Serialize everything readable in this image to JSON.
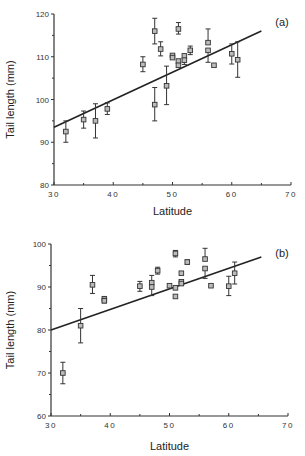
{
  "chart_data": [
    {
      "type": "scatter",
      "panel_label": "(a)",
      "title": "",
      "xlabel": "Latitude",
      "ylabel": "Tail length (mm)",
      "xlim": [
        30,
        70
      ],
      "ylim": [
        80,
        120
      ],
      "x_ticks": [
        30,
        40,
        50,
        60,
        70
      ],
      "y_ticks": [
        80,
        90,
        100,
        110,
        120
      ],
      "grid": false,
      "legend": null,
      "points": [
        {
          "x": 32,
          "y": 92.5,
          "lo": 90.0,
          "hi": 95.0
        },
        {
          "x": 35,
          "y": 95.3,
          "lo": 93.3,
          "hi": 97.3
        },
        {
          "x": 37,
          "y": 95.0,
          "lo": 91.0,
          "hi": 99.0
        },
        {
          "x": 39,
          "y": 97.8,
          "lo": 96.5,
          "hi": 99.2
        },
        {
          "x": 45,
          "y": 108.2,
          "lo": 106.5,
          "hi": 110.0
        },
        {
          "x": 47,
          "y": 116.0,
          "lo": 113.0,
          "hi": 119.0
        },
        {
          "x": 47,
          "y": 98.8,
          "lo": 95.0,
          "hi": 102.8
        },
        {
          "x": 48,
          "y": 111.8,
          "lo": 110.2,
          "hi": 113.5
        },
        {
          "x": 49,
          "y": 103.2,
          "lo": 98.8,
          "hi": 107.8
        },
        {
          "x": 50,
          "y": 110.3,
          "lo": null,
          "hi": null
        },
        {
          "x": 50,
          "y": 109.8,
          "lo": null,
          "hi": null
        },
        {
          "x": 51,
          "y": 116.5,
          "lo": 115.3,
          "hi": 118.0
        },
        {
          "x": 51,
          "y": 109.0,
          "lo": null,
          "hi": null
        },
        {
          "x": 51,
          "y": 108.0,
          "lo": null,
          "hi": null
        },
        {
          "x": 52,
          "y": 110.2,
          "lo": null,
          "hi": null
        },
        {
          "x": 52,
          "y": 109.2,
          "lo": 108.2,
          "hi": null
        },
        {
          "x": 53,
          "y": 111.5,
          "lo": 110.5,
          "hi": 112.5
        },
        {
          "x": 56,
          "y": 113.3,
          "lo": null,
          "hi": 116.5
        },
        {
          "x": 56,
          "y": 111.5,
          "lo": 108.7,
          "hi": null
        },
        {
          "x": 57,
          "y": 108.0,
          "lo": null,
          "hi": null
        },
        {
          "x": 60,
          "y": 110.7,
          "lo": 108.3,
          "hi": 113.0
        },
        {
          "x": 61,
          "y": 109.3,
          "lo": 105.2,
          "hi": 113.5
        }
      ],
      "regression_line": {
        "x": [
          30,
          65
        ],
        "y": [
          93.5,
          116.0
        ]
      }
    },
    {
      "type": "scatter",
      "panel_label": "(b)",
      "title": "",
      "xlabel": "Latitude",
      "ylabel": "Tail length (mm)",
      "xlim": [
        30,
        70
      ],
      "ylim": [
        60,
        100
      ],
      "x_ticks": [
        30,
        40,
        50,
        60,
        70
      ],
      "y_ticks": [
        60,
        70,
        80,
        90,
        100
      ],
      "grid": false,
      "legend": null,
      "points": [
        {
          "x": 32,
          "y": 70.0,
          "lo": 67.5,
          "hi": 72.5
        },
        {
          "x": 35,
          "y": 81.0,
          "lo": 77.0,
          "hi": 85.0
        },
        {
          "x": 37,
          "y": 90.5,
          "lo": 88.5,
          "hi": 92.7
        },
        {
          "x": 39,
          "y": 87.2,
          "lo": null,
          "hi": 87.8
        },
        {
          "x": 39,
          "y": 86.8,
          "lo": 86.3,
          "hi": null
        },
        {
          "x": 45,
          "y": 90.2,
          "lo": 89.0,
          "hi": 91.3
        },
        {
          "x": 47,
          "y": 91.0,
          "lo": null,
          "hi": 92.7
        },
        {
          "x": 47,
          "y": 90.0,
          "lo": 88.0,
          "hi": null
        },
        {
          "x": 48,
          "y": 93.8,
          "lo": 93.0,
          "hi": 94.6
        },
        {
          "x": 50,
          "y": 90.3,
          "lo": null,
          "hi": null
        },
        {
          "x": 51,
          "y": 97.8,
          "lo": 97.0,
          "hi": 98.5
        },
        {
          "x": 51,
          "y": 89.8,
          "lo": null,
          "hi": null
        },
        {
          "x": 51,
          "y": 87.8,
          "lo": null,
          "hi": null
        },
        {
          "x": 52,
          "y": 93.2,
          "lo": null,
          "hi": null
        },
        {
          "x": 52,
          "y": 91.2,
          "lo": null,
          "hi": null
        },
        {
          "x": 52,
          "y": 90.8,
          "lo": null,
          "hi": null
        },
        {
          "x": 53,
          "y": 95.8,
          "lo": 95.3,
          "hi": 96.3
        },
        {
          "x": 56,
          "y": 96.5,
          "lo": null,
          "hi": 99.0
        },
        {
          "x": 56,
          "y": 94.3,
          "lo": 92.0,
          "hi": null
        },
        {
          "x": 57,
          "y": 90.3,
          "lo": null,
          "hi": null
        },
        {
          "x": 60,
          "y": 90.2,
          "lo": 88.0,
          "hi": 92.5
        },
        {
          "x": 61,
          "y": 93.2,
          "lo": 90.7,
          "hi": 95.8
        }
      ],
      "regression_line": {
        "x": [
          30,
          65.5
        ],
        "y": [
          80.0,
          97.0
        ]
      }
    }
  ],
  "layout": [
    {
      "x0": 54,
      "x1": 291,
      "y_top": 14,
      "y_bot": 185,
      "xlabel_y": 215,
      "ylabel_x": 14,
      "panel_x": 282,
      "panel_y": 26
    },
    {
      "x0": 51,
      "x1": 288,
      "y_top": 244,
      "y_bot": 416,
      "xlabel_y": 450,
      "ylabel_x": 14,
      "panel_x": 282,
      "panel_y": 257
    }
  ]
}
